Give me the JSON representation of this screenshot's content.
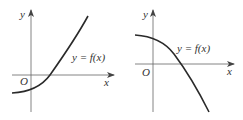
{
  "graphs": [
    {
      "id": "left",
      "y_axis_label": "y",
      "x_axis_label": "x",
      "origin_label": "O",
      "curve_label": "y = f(x)",
      "description": "increasing concave-up curve crossing the x-axis to the right of the origin"
    },
    {
      "id": "right",
      "y_axis_label": "y",
      "x_axis_label": "x",
      "origin_label": "O",
      "curve_label": "y = f(x)",
      "description": "decreasing concave-down curve crossing the x-axis to the right of the origin"
    }
  ],
  "colors": {
    "curve": "#2a2a2a",
    "axis": "#555555",
    "text": "#333333"
  }
}
